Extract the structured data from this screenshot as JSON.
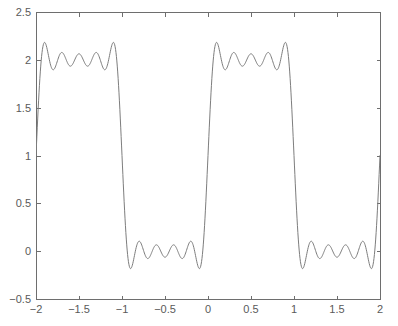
{
  "chart_data": {
    "type": "line",
    "title": "",
    "subtitle": "",
    "xlabel": "",
    "ylabel": "",
    "xlim": [
      -2,
      2
    ],
    "ylim": [
      -0.5,
      2.5
    ],
    "grid": false,
    "legend": null,
    "legend_position": "none",
    "annotations": [],
    "xticks": [
      -2,
      -1.5,
      -1,
      -0.5,
      0,
      0.5,
      1,
      1.5,
      2
    ],
    "xtick_labels": [
      "−2",
      "−1.5",
      "−1",
      "−0.5",
      "0",
      "0.5",
      "1",
      "1.5",
      "2"
    ],
    "yticks": [
      -0.5,
      0,
      0.5,
      1,
      1.5,
      2,
      2.5
    ],
    "ytick_labels": [
      "−0.5",
      "0",
      "0.5",
      "1",
      "1.5",
      "2",
      "2.5"
    ],
    "series": [
      {
        "name": "5-term Fourier partial sum of square wave",
        "color": "#7d7d7d",
        "linewidth": 1,
        "formula": "1 + (4/pi)*(sin(pi*x)/1 + sin(3*pi*x)/3 + sin(5*pi*x)/5 + sin(7*pi*x)/7 + sin(9*pi*x)/9)",
        "harmonics": [
          1,
          3,
          5,
          7,
          9
        ],
        "dc_offset": 1,
        "amplitude_factor": 1.2732395447351628,
        "period": 2,
        "samples": 801,
        "x_start": -2,
        "x_end": 2,
        "upper_plateau_level": 2,
        "lower_plateau_level": 0,
        "max_overshoot": 2.18,
        "min_undershoot": -0.18,
        "ripple_extrema_per_plateau": 5,
        "value_at_x_minus_2": 1,
        "value_at_x_2": 1
      }
    ]
  },
  "axes": {
    "box_left_px": 36,
    "box_right_px": 380,
    "box_top_px": 12,
    "box_bottom_px": 299,
    "frame_color": "#6e6e6e",
    "tick_direction": "in",
    "tick_length_px": 4,
    "background": "#ffffff"
  },
  "figure": {
    "width_px": 398,
    "height_px": 326,
    "background": "#ffffff"
  }
}
